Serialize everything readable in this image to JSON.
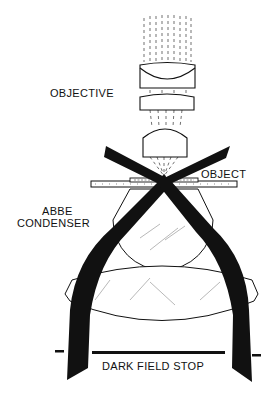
{
  "diagram": {
    "type": "optical schematic",
    "labels": {
      "objective": "OBJECTIVE",
      "object": "OBJECT",
      "condenser_line1": "ABBE",
      "condenser_line2": "CONDENSER",
      "stop": "DARK FIELD STOP"
    },
    "components": [
      {
        "id": "objective",
        "description": "three-element objective lens stack with parallel dashed rays above"
      },
      {
        "id": "object",
        "description": "specimen on glass slide where illumination cones cross"
      },
      {
        "id": "abbe-condenser",
        "description": "hemispherical top lens plus large biconvex lower lens"
      },
      {
        "id": "dark-field-stop",
        "description": "opaque central disk blocking axial light beneath condenser"
      },
      {
        "id": "illumination-beams",
        "description": "hollow cone of light (black bands) passing around the stop, crossing at the object and missing the objective"
      }
    ],
    "colors": {
      "ink": "#111111",
      "background": "#ffffff"
    }
  }
}
